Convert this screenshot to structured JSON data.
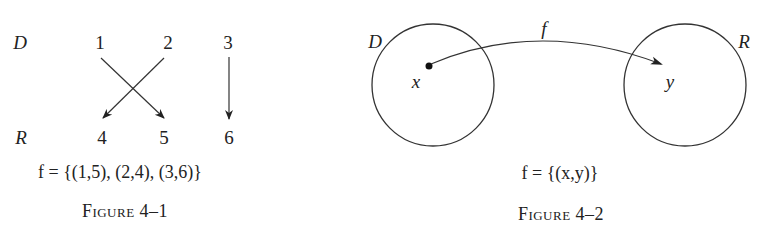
{
  "figures": [
    {
      "id": "figure-4-1",
      "caption": "Figure 4–1",
      "domain_label": "D",
      "range_label": "R",
      "domain_elements": [
        "1",
        "2",
        "3"
      ],
      "range_elements": [
        "4",
        "5",
        "6"
      ],
      "mappings": [
        {
          "from": "1",
          "to": "5"
        },
        {
          "from": "2",
          "to": "4"
        },
        {
          "from": "3",
          "to": "6"
        }
      ],
      "formula": "f = {(1,5), (2,4), (3,6)}"
    },
    {
      "id": "figure-4-2",
      "caption": "Figure 4–2",
      "domain_label": "D",
      "range_label": "R",
      "domain_point": "x",
      "range_point": "y",
      "arrow_label": "f",
      "formula": "f = {(x,y)}"
    }
  ],
  "colors": {
    "ink": "#222222",
    "background": "#ffffff"
  }
}
